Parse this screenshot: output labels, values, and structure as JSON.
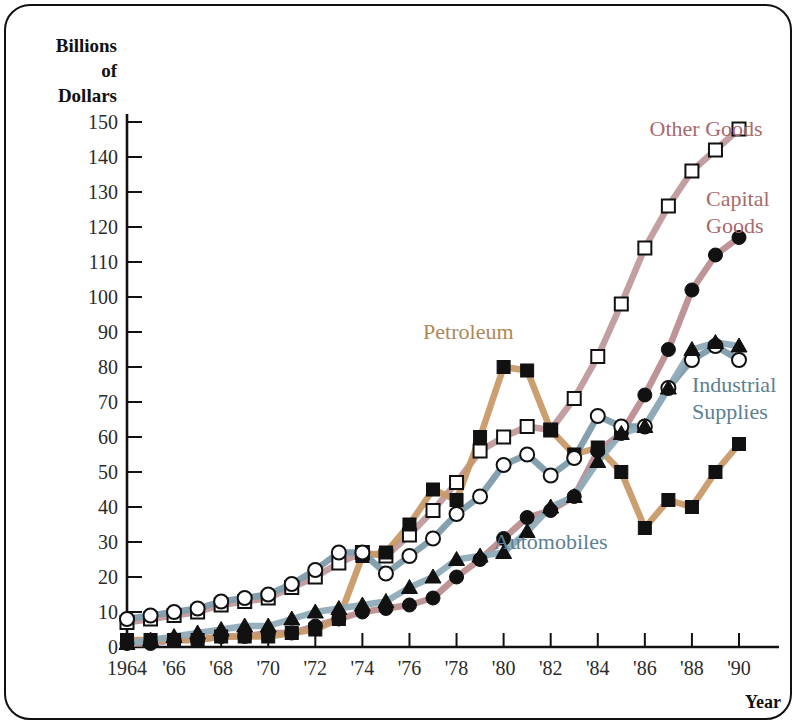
{
  "figure": {
    "y_axis_title_lines": [
      "Billions",
      "of",
      "Dollars"
    ],
    "x_axis_title": "Year"
  },
  "chart_data": {
    "type": "line",
    "title": "",
    "xlabel": "Year",
    "ylabel": "Billions of Dollars",
    "xlim": [
      1964,
      1990
    ],
    "ylim": [
      0,
      150
    ],
    "ytick_step": 10,
    "grid": false,
    "legend_position": "inline-annotations",
    "x": [
      1964,
      1965,
      1966,
      1967,
      1968,
      1969,
      1970,
      1971,
      1972,
      1973,
      1974,
      1975,
      1976,
      1977,
      1978,
      1979,
      1980,
      1981,
      1982,
      1983,
      1984,
      1985,
      1986,
      1987,
      1988,
      1989,
      1990
    ],
    "xtick_labels": [
      "1964",
      "'66",
      "'68",
      "'70",
      "'72",
      "'74",
      "'76",
      "'78",
      "'80",
      "'82",
      "'84",
      "'86",
      "'88",
      "'90"
    ],
    "ytick_labels": [
      "0",
      "10",
      "20",
      "30",
      "40",
      "50",
      "60",
      "70",
      "80",
      "90",
      "100",
      "110",
      "120",
      "130",
      "140",
      "150"
    ],
    "series": [
      {
        "name": "Other Goods",
        "label": "Other Goods",
        "marker": "open-square",
        "color": "#c09a9c",
        "label_color": "#a86a6c",
        "values": [
          7,
          8,
          9,
          10,
          12,
          13,
          14,
          17,
          20,
          24,
          27,
          26,
          32,
          39,
          47,
          56,
          60,
          63,
          62,
          71,
          83,
          98,
          114,
          126,
          136,
          142,
          148
        ]
      },
      {
        "name": "Capital Goods",
        "label": "Capital Goods",
        "marker": "filled-circle",
        "color": "#ba8e91",
        "label_color": "#a86a6c",
        "values": [
          1,
          1,
          2,
          2,
          3,
          3,
          4,
          4,
          6,
          8,
          10,
          11,
          12,
          14,
          20,
          25,
          31,
          37,
          39,
          43,
          56,
          61,
          72,
          85,
          102,
          112,
          117
        ]
      },
      {
        "name": "Petroleum",
        "label": "Petroleum",
        "marker": "filled-square",
        "color": "#c89a68",
        "label_color": "#ae8856",
        "values": [
          2,
          2,
          2,
          2,
          3,
          3,
          3,
          4,
          5,
          8,
          26,
          27,
          35,
          45,
          42,
          60,
          80,
          79,
          62,
          55,
          57,
          50,
          34,
          42,
          40,
          50,
          58
        ]
      },
      {
        "name": "Industrial Supplies",
        "label": "Industrial Supplies",
        "marker": "open-circle",
        "color": "#7e9cab",
        "label_color": "#5b7f92",
        "values": [
          8,
          9,
          10,
          11,
          13,
          14,
          15,
          18,
          22,
          27,
          27,
          21,
          26,
          31,
          38,
          43,
          52,
          55,
          49,
          54,
          66,
          63,
          63,
          74,
          82,
          86,
          82
        ]
      },
      {
        "name": "Automobiles",
        "label": "Automobiles",
        "marker": "filled-triangle",
        "color": "#8fabb8",
        "label_color": "#5b7f92",
        "values": [
          1,
          2,
          3,
          4,
          5,
          6,
          6,
          8,
          10,
          11,
          12,
          13,
          17,
          20,
          25,
          26,
          27,
          33,
          40,
          43,
          53,
          61,
          63,
          74,
          85,
          87,
          86
        ]
      }
    ],
    "annotations": [
      {
        "text": "Other Goods",
        "x": 1986.2,
        "y": 146
      },
      {
        "text": "Capital Goods",
        "x": 1988.6,
        "y": 126
      },
      {
        "text": "Industrial Supplies",
        "x": 1988.0,
        "y": 73
      },
      {
        "text": "Petroleum",
        "x": 1978.5,
        "y": 88
      },
      {
        "text": "Automobiles",
        "x": 1982.0,
        "y": 28
      }
    ]
  }
}
